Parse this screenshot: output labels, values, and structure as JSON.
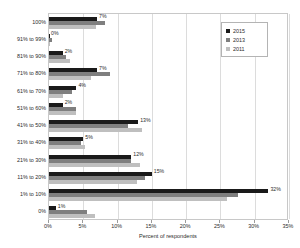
{
  "chart_data": {
    "type": "bar",
    "orientation": "horizontal",
    "title": "",
    "xlabel": "Percent of respondents",
    "ylabel": "",
    "xlim": [
      0,
      35
    ],
    "xticks": [
      "0%",
      "5%",
      "10%",
      "15%",
      "20%",
      "25%",
      "30%",
      "35%"
    ],
    "xtick_values": [
      0,
      5,
      10,
      15,
      20,
      25,
      30,
      35
    ],
    "grid": true,
    "grid_axis": "x",
    "legend_position": "top-right",
    "categories": [
      "100%",
      "91% to 99%",
      "81% to 90%",
      "71% to 80%",
      "61% to 70%",
      "51% to 60%",
      "41% to 50%",
      "31% to 40%",
      "21% to 30%",
      "11% to 20%",
      "1% to 10%",
      "0%"
    ],
    "series": [
      {
        "name": "2015",
        "color": "#1a1a1a",
        "values": [
          7,
          0,
          2,
          7,
          4,
          2,
          13,
          5,
          12,
          15,
          32,
          1
        ]
      },
      {
        "name": "2013",
        "color": "#7f7f7f",
        "values": [
          8.2,
          0.4,
          2.5,
          8.9,
          3.4,
          4.0,
          11.5,
          4.6,
          11.9,
          14.0,
          27.5,
          5.5
        ]
      },
      {
        "name": "2011",
        "color": "#bfbfbf",
        "values": [
          6.9,
          0.2,
          3.0,
          6.1,
          2.1,
          4.0,
          13.5,
          5.3,
          13.2,
          12.9,
          26.0,
          6.7
        ]
      }
    ],
    "data_labels": {
      "series": "2015",
      "values": [
        "7%",
        "0%",
        "2%",
        "7%",
        "4%",
        "2%",
        "13%",
        "5%",
        "12%",
        "15%",
        "32%",
        "1%"
      ]
    }
  },
  "legend": {
    "entries": [
      {
        "label": "2015",
        "color": "#1a1a1a"
      },
      {
        "label": "2013",
        "color": "#7f7f7f"
      },
      {
        "label": "2011",
        "color": "#bfbfbf"
      }
    ]
  }
}
